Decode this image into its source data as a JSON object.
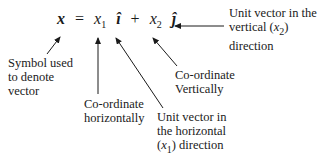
{
  "equation": {
    "lhs": "x",
    "equals": "=",
    "term1_coord": "x",
    "term1_sub": "1",
    "term1_unit": "î",
    "plus": "+",
    "term2_coord": "x",
    "term2_sub": "2",
    "term2_unit": "ĵ"
  },
  "labels": {
    "symbol": [
      "Symbol used",
      "to denote",
      "vector"
    ],
    "coord_h": [
      "Co-ordinate",
      "horizontally"
    ],
    "unit_h": [
      "Unit vector in",
      "the horizontal",
      "direction"
    ],
    "unit_h_var": "x",
    "unit_h_sub": "1",
    "coord_v": [
      "Co-ordinate",
      "Vertically"
    ],
    "unit_v": [
      "Unit vector in the",
      "vertical",
      "direction"
    ],
    "unit_v_var": "x",
    "unit_v_sub": "2"
  }
}
